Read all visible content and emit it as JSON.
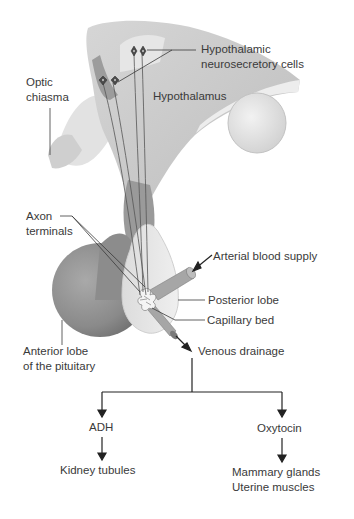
{
  "diagram": {
    "labels": {
      "hypothalamic_cells_line1": "Hypothalamic",
      "hypothalamic_cells_line2": "neurosecretory cells",
      "optic_line1": "Optic",
      "optic_line2": "chiasma",
      "hypothalamus": "Hypothalamus",
      "axon_line1": "Axon",
      "axon_line2": "terminals",
      "arterial": "Arterial blood supply",
      "posterior_lobe": "Posterior lobe",
      "capillary_bed": "Capillary bed",
      "anterior_line1": "Anterior lobe",
      "anterior_line2": "of the pituitary",
      "venous": "Venous drainage"
    },
    "flow": {
      "left_hormone": "ADH",
      "left_target": "Kidney tubules",
      "right_hormone": "Oxytocin",
      "right_target_line1": "Mammary glands",
      "right_target_line2": "Uterine muscles"
    },
    "colors": {
      "tissue_light": "#e6e6e6",
      "tissue_mid": "#c8c8c8",
      "tissue_dark": "#8f8f8f",
      "line": "#3a3a3a",
      "text": "#3a3a3a"
    }
  }
}
